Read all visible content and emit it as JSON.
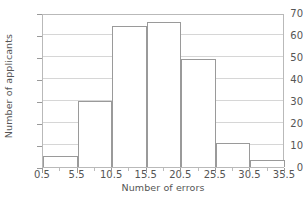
{
  "chart_data": {
    "type": "bar",
    "chart_subtype": "histogram",
    "title": "",
    "xlabel": "Number of errors",
    "ylabel": "Number of applicants",
    "categories": [
      "0.5-5.5",
      "5.5-10.5",
      "10.5-15.5",
      "15.5-20.5",
      "20.5-25.5",
      "25.5-30.5",
      "30.5-35.5"
    ],
    "bin_edges": [
      0.5,
      5.5,
      10.5,
      15.5,
      20.5,
      25.5,
      30.5,
      35.5
    ],
    "values": [
      5,
      30,
      64,
      66,
      49,
      11,
      3
    ],
    "xlim": [
      0.5,
      35.5
    ],
    "ylim": [
      0,
      70
    ],
    "xticks": [
      0.5,
      5.5,
      10.5,
      15.5,
      20.5,
      25.5,
      30.5,
      35.5
    ],
    "xtick_labels": [
      "0.5",
      "5.5",
      "10.5",
      "15.5",
      "20.5",
      "25.5",
      "30.5",
      "35.5"
    ],
    "yticks": [
      0,
      10,
      20,
      30,
      40,
      50,
      60,
      70
    ],
    "ytick_labels": [
      "0",
      "10",
      "20",
      "30",
      "40",
      "50",
      "60",
      "70"
    ],
    "xticks_minor": [
      3.0,
      8.0,
      13.0,
      18.0,
      23.0,
      28.0,
      33.0
    ],
    "grid": "horizontal",
    "legend": null,
    "bar_fill_color": "#ffffff",
    "bar_edge_color": "#9a9a9a",
    "gridline_color": "#d6d6d6",
    "frame_color": "#b9b9b9",
    "text_color": "#555555"
  }
}
